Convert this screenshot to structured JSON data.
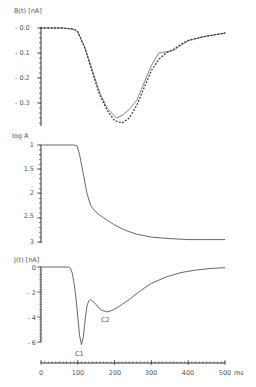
{
  "chart_data": [
    {
      "type": "line",
      "title": "",
      "ylabel": "B(t) [nA]",
      "xlabel": "",
      "xlim": [
        0,
        500
      ],
      "ylim": [
        -0.39,
        0.0
      ],
      "yticks": [
        "-0.0",
        "-0.1",
        "-0.2",
        "-0.3"
      ],
      "ytick_values": [
        0.0,
        -0.1,
        -0.2,
        -0.3
      ],
      "grid": false,
      "legend": "none",
      "series": [
        {
          "name": "measured",
          "style": "solid",
          "x": [
            0,
            60,
            90,
            100,
            120,
            140,
            160,
            180,
            205,
            220,
            240,
            260,
            280,
            300,
            320,
            340,
            360,
            380,
            400,
            440,
            480,
            500
          ],
          "values": [
            0.0,
            0.0,
            -0.005,
            -0.015,
            -0.08,
            -0.17,
            -0.26,
            -0.32,
            -0.36,
            -0.35,
            -0.325,
            -0.29,
            -0.22,
            -0.15,
            -0.1,
            -0.095,
            -0.09,
            -0.07,
            -0.05,
            -0.035,
            -0.025,
            -0.02
          ]
        },
        {
          "name": "computed",
          "style": "dotted",
          "x": [
            0,
            60,
            90,
            100,
            120,
            140,
            160,
            180,
            200,
            220,
            240,
            260,
            280,
            300,
            320,
            340,
            360,
            380,
            400,
            440,
            480,
            500
          ],
          "values": [
            0.0,
            0.0,
            -0.005,
            -0.015,
            -0.085,
            -0.18,
            -0.27,
            -0.33,
            -0.37,
            -0.38,
            -0.36,
            -0.31,
            -0.24,
            -0.17,
            -0.125,
            -0.1,
            -0.085,
            -0.065,
            -0.05,
            -0.035,
            -0.025,
            -0.02
          ]
        }
      ]
    },
    {
      "type": "line",
      "title": "",
      "ylabel": "log A",
      "xlabel": "",
      "xlim": [
        0,
        500
      ],
      "ylim": [
        1,
        3
      ],
      "y_inverted": true,
      "yticks": [
        "1",
        "1.5",
        "2",
        "2.5",
        "3"
      ],
      "ytick_values": [
        1,
        1.5,
        2,
        2.5,
        3
      ],
      "grid": false,
      "legend": "none",
      "series": [
        {
          "name": "log A",
          "style": "solid",
          "x": [
            0,
            90,
            98,
            105,
            115,
            125,
            135,
            145,
            160,
            180,
            200,
            230,
            260,
            300,
            350,
            400,
            450,
            500
          ],
          "values": [
            1.0,
            1.0,
            1.02,
            1.2,
            1.6,
            2.0,
            2.25,
            2.35,
            2.45,
            2.55,
            2.65,
            2.76,
            2.84,
            2.9,
            2.93,
            2.95,
            2.95,
            2.95
          ]
        }
      ]
    },
    {
      "type": "line",
      "title": "",
      "ylabel": "J(t) [nA]",
      "xlabel": "ms",
      "xlim": [
        0,
        500
      ],
      "ylim": [
        -6.3,
        0
      ],
      "yticks": [
        "0",
        "-2",
        "-4",
        "-6"
      ],
      "ytick_values": [
        0,
        -2,
        -4,
        -6
      ],
      "xticks": [
        "0",
        "100",
        "200",
        "300",
        "400",
        "500"
      ],
      "xtick_values": [
        0,
        100,
        200,
        300,
        400,
        500
      ],
      "grid": false,
      "legend": "none",
      "annotations": [
        {
          "text": "C1",
          "x": 105,
          "y": -6.2
        },
        {
          "text": "C2",
          "x": 180,
          "y": -3.6
        }
      ],
      "series": [
        {
          "name": "J(t)",
          "style": "solid",
          "x": [
            0,
            75,
            80,
            85,
            90,
            95,
            100,
            105,
            110,
            115,
            120,
            125,
            130,
            135,
            145,
            155,
            165,
            180,
            195,
            210,
            240,
            270,
            300,
            340,
            380,
            420,
            460,
            500
          ],
          "values": [
            0,
            0,
            -0.1,
            -0.5,
            -1.3,
            -2.5,
            -4.0,
            -5.5,
            -6.2,
            -5.6,
            -4.2,
            -3.1,
            -2.7,
            -2.6,
            -2.85,
            -3.2,
            -3.45,
            -3.6,
            -3.45,
            -3.2,
            -2.6,
            -1.9,
            -1.3,
            -0.8,
            -0.45,
            -0.25,
            -0.12,
            -0.05
          ]
        }
      ]
    }
  ],
  "labels": {
    "top_ylabel": "B(t) [nA]",
    "mid_ylabel": "log A",
    "bot_ylabel": "J(t) [nA]",
    "x_unit": "ms",
    "c1": "C1",
    "c2": "C2"
  },
  "ticks": {
    "top": [
      "- 0.0",
      "- 0.1",
      "- 0.2",
      "- 0.3"
    ],
    "mid": [
      "1",
      "1.5",
      "2",
      "2.5",
      "3"
    ],
    "bot": [
      "0",
      "- 2",
      "- 4",
      "- 6"
    ],
    "x": [
      "0",
      "100",
      "200",
      "300",
      "400",
      "500"
    ]
  },
  "colors": {
    "line": "#555555",
    "axis": "#333333",
    "text": "#555555"
  }
}
